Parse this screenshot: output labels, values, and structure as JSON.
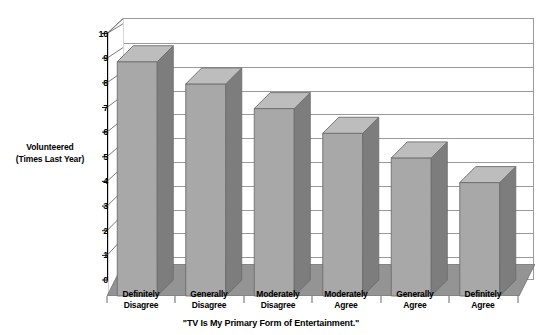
{
  "chart_data": {
    "type": "bar",
    "title": "",
    "xlabel": "\"TV Is My Primary Form of Entertainment.\"",
    "ylabel": "Volunteered (Times Last Year)",
    "ylabel_line1": "Volunteered",
    "ylabel_line2": "(Times Last Year)",
    "categories": [
      "Definitely Disagree",
      "Generally Disagree",
      "Moderately Disagree",
      "Moderately Agree",
      "Generally Agree",
      "Definitely Agree"
    ],
    "category_lines": [
      [
        "Definitely",
        "Disagree"
      ],
      [
        "Generally",
        "Disagree"
      ],
      [
        "Moderately",
        "Disagree"
      ],
      [
        "Moderately",
        "Agree"
      ],
      [
        "Generally",
        "Agree"
      ],
      [
        "Definitely",
        "Agree"
      ]
    ],
    "values": [
      9.5,
      8.6,
      7.6,
      6.6,
      5.6,
      4.6
    ],
    "ylim": [
      0,
      10
    ],
    "ytick_labels": [
      "0",
      "1",
      "2",
      "3",
      "4",
      "5",
      "6",
      "7",
      "8",
      "9",
      "10"
    ],
    "ytick_values": [
      0,
      1,
      2,
      3,
      4,
      5,
      6,
      7,
      8,
      9,
      10
    ],
    "grid": true,
    "legend": "none",
    "style": "3d-column",
    "colors": {
      "bar_front": "#a8a8a8",
      "bar_top": "#bdbdbd",
      "bar_side": "#7d7d7d",
      "bar_outline": "#6d6d6d",
      "floor": "#949494",
      "wall": "#ffffff",
      "gridline": "#9a9a9a",
      "axis": "#000000",
      "text": "#000000"
    }
  }
}
